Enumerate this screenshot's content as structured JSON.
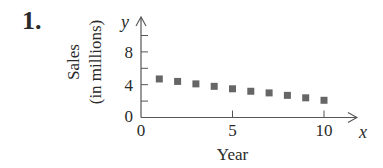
{
  "problem_number": "1.",
  "chart_data": {
    "type": "scatter",
    "title": "",
    "xlabel": "Year",
    "ylabel": "Sales (in millions)",
    "ylabel_lines": [
      "Sales",
      "(in millions)"
    ],
    "x_axis_name": "x",
    "y_axis_name": "y",
    "x": [
      1,
      2,
      3,
      4,
      5,
      6,
      7,
      8,
      9,
      10
    ],
    "y": [
      4.7,
      4.4,
      4.1,
      3.8,
      3.5,
      3.2,
      3.0,
      2.7,
      2.4,
      2.1
    ],
    "xlim": [
      0,
      11
    ],
    "ylim": [
      0,
      10
    ],
    "x_ticks": [
      0,
      5,
      10
    ],
    "x_tick_labels": [
      "0",
      "5",
      "10"
    ],
    "y_ticks": [
      0,
      2,
      4,
      6,
      8,
      10
    ],
    "y_tick_labels": [
      "0",
      "",
      "4",
      "",
      "8",
      ""
    ],
    "grid": false,
    "legend": null,
    "marker": "square",
    "marker_color": "#666666"
  }
}
